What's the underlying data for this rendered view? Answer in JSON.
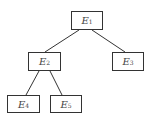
{
  "diagram": {
    "type": "tree",
    "nodes": [
      {
        "id": "E1",
        "label": "E",
        "sub": "1",
        "x": 71,
        "y": 11,
        "w": 32,
        "h": 19
      },
      {
        "id": "E2",
        "label": "E",
        "sub": "2",
        "x": 28,
        "y": 52,
        "w": 33,
        "h": 19
      },
      {
        "id": "E3",
        "label": "E",
        "sub": "3",
        "x": 112,
        "y": 52,
        "w": 32,
        "h": 19
      },
      {
        "id": "E4",
        "label": "E",
        "sub": "4",
        "x": 7,
        "y": 95,
        "w": 33,
        "h": 18
      },
      {
        "id": "E5",
        "label": "E",
        "sub": "5",
        "x": 50,
        "y": 95,
        "w": 32,
        "h": 18
      }
    ],
    "edges": [
      {
        "from": "E1",
        "to": "E2",
        "x1": 79,
        "y1": 30,
        "x2": 45,
        "y2": 52
      },
      {
        "from": "E1",
        "to": "E3",
        "x1": 92,
        "y1": 30,
        "x2": 125,
        "y2": 52
      },
      {
        "from": "E2",
        "to": "E4",
        "x1": 39,
        "y1": 71,
        "x2": 26,
        "y2": 95
      },
      {
        "from": "E2",
        "to": "E5",
        "x1": 50,
        "y1": 71,
        "x2": 62,
        "y2": 95
      }
    ],
    "colors": {
      "stroke": "#333333",
      "text": "#444444",
      "background": "#ffffff"
    }
  }
}
